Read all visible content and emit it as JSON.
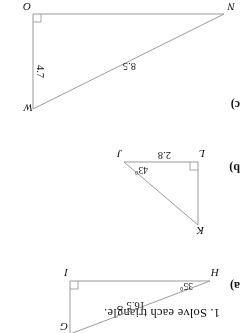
{
  "page": {
    "rotation_degrees": 180,
    "ink_color": "#9a9a9a",
    "text_color": "#111111",
    "background": "#ffffff"
  },
  "worksheet": {
    "prompt": "1.  Solve each triangle.",
    "items": [
      {
        "label": "a)",
        "vertices": [
          "H",
          "I",
          "G"
        ],
        "right_angle_at": "I",
        "angle_label": "35°",
        "side_label": "16.5"
      },
      {
        "label": "b)",
        "vertices": [
          "L",
          "J",
          "K"
        ],
        "right_angle_at": "L",
        "angle_label": "43°",
        "side_label": "2.8"
      },
      {
        "label": "c)",
        "vertices": [
          "N",
          "O",
          "W"
        ],
        "right_angle_at": "O",
        "side_labels": [
          "8.5",
          "4.7"
        ]
      }
    ]
  }
}
